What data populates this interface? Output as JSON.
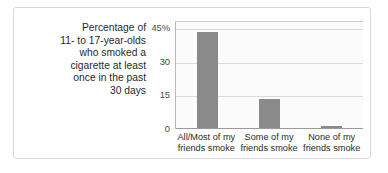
{
  "caption": {
    "lines": [
      "Percentage of",
      "11- to 17-year-olds",
      "who smoked a",
      "cigarette at least",
      "once in the past",
      "30 days"
    ]
  },
  "colors": {
    "bar": "#8a8a8a",
    "frame": "#d6d6d6",
    "gridline": "#d9d9d9",
    "text": "#2a2a2a",
    "background": "#ffffff"
  },
  "chart_data": {
    "type": "bar",
    "title": "",
    "xlabel": "",
    "ylabel": "Percentage of 11- to 17-year-olds who smoked a cigarette at least once in the past 30 days",
    "categories": [
      "All/Most of my friends smoke",
      "Some of my friends smoke",
      "None of my friends smoke"
    ],
    "category_lines": [
      [
        "All/Most of my",
        "friends smoke"
      ],
      [
        "Some of my",
        "friends smoke"
      ],
      [
        "None of my",
        "friends smoke"
      ]
    ],
    "values": [
      43,
      13,
      1
    ],
    "ylim": [
      0,
      48
    ],
    "yticks": [
      0,
      15,
      30,
      45
    ],
    "ytick_labels": [
      "0",
      "15",
      "30",
      "45%"
    ],
    "grid": true,
    "legend": "none"
  }
}
